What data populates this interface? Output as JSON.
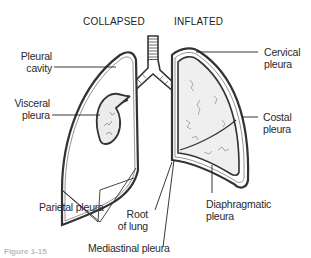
{
  "diagram": {
    "headers": {
      "collapsed": "COLLAPSED",
      "inflated": "INFLATED"
    },
    "labels": {
      "pleural_cavity": [
        "Pleural",
        "cavity"
      ],
      "visceral_pleura": [
        "Visceral",
        "pleura"
      ],
      "parietal_pleura": "Parietal pleura",
      "root_of_lung": [
        "Root",
        "of lung"
      ],
      "mediastinal_pleura": "Mediastinal pleura",
      "cervical_pleura": [
        "Cervical",
        "pleura"
      ],
      "costal_pleura": [
        "Costal",
        "pleura"
      ],
      "diaphragmatic_pleura": [
        "Diaphragmatic",
        "pleura"
      ]
    },
    "caption": "Figure 1-15"
  }
}
